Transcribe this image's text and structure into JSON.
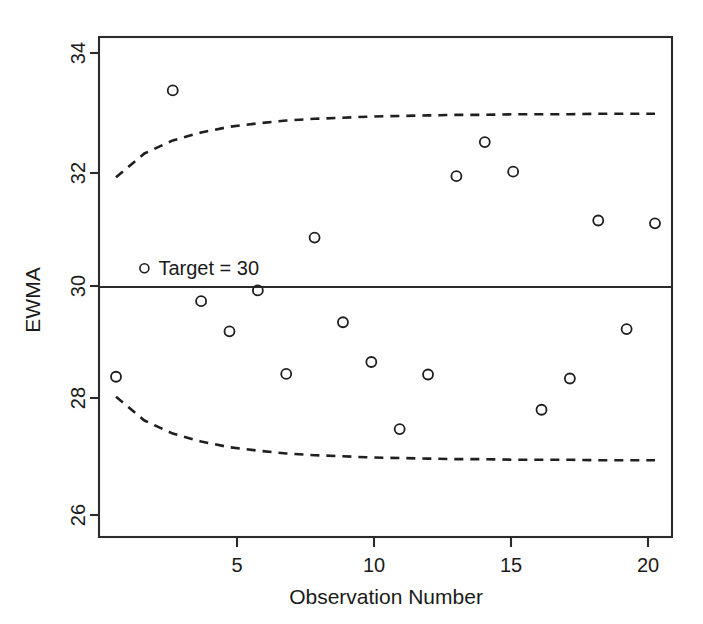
{
  "chart_data": {
    "type": "scatter",
    "title": "",
    "xlabel": "Observation Number",
    "ylabel": "EWMA",
    "xlim": [
      0.4,
      20.6
    ],
    "ylim": [
      25.6,
      34.4
    ],
    "xticks": [
      5,
      10,
      15,
      20
    ],
    "xtick_labels": [
      "5",
      "10",
      "15",
      "20"
    ],
    "yticks": [
      26,
      28,
      30,
      32,
      34
    ],
    "ytick_labels": [
      "26",
      "28",
      "30",
      "32",
      "34"
    ],
    "grid": false,
    "legend_position": "upper-left-inside",
    "annotations": [
      {
        "name": "target-annotation",
        "text": "Target = 30",
        "marker": "open-circle",
        "x": 2.0,
        "y": 30.33
      }
    ],
    "center_line": {
      "name": "Target",
      "value": 30
    },
    "series": [
      {
        "name": "EWMA",
        "marker": "open-circle",
        "x": [
          1,
          2,
          3,
          4,
          5,
          6,
          7,
          8,
          9,
          10,
          11,
          12,
          13,
          14,
          15,
          16,
          17,
          18,
          19,
          20
        ],
        "values": [
          28.42,
          33.46,
          33.46,
          29.75,
          29.22,
          29.94,
          28.47,
          30.87,
          29.38,
          28.68,
          27.5,
          28.46,
          31.95,
          32.55,
          32.03,
          27.84,
          28.39,
          31.17,
          29.26,
          31.12
        ],
        "points_drawn": [
          {
            "obs": 1,
            "value": 28.42
          },
          {
            "obs": 3,
            "value": 33.46
          },
          {
            "obs": 4,
            "value": 29.75
          },
          {
            "obs": 5,
            "value": 29.22
          },
          {
            "obs": 6,
            "value": 29.94
          },
          {
            "obs": 7,
            "value": 28.47
          },
          {
            "obs": 8,
            "value": 30.87
          },
          {
            "obs": 9,
            "value": 29.38
          },
          {
            "obs": 10,
            "value": 28.68
          },
          {
            "obs": 11,
            "value": 27.5
          },
          {
            "obs": 12,
            "value": 28.46
          },
          {
            "obs": 13,
            "value": 31.95
          },
          {
            "obs": 14,
            "value": 32.55
          },
          {
            "obs": 15,
            "value": 32.03
          },
          {
            "obs": 16,
            "value": 27.84
          },
          {
            "obs": 17,
            "value": 28.39
          },
          {
            "obs": 18,
            "value": 31.17
          },
          {
            "obs": 19,
            "value": 29.26
          },
          {
            "obs": 20,
            "value": 31.12
          }
        ]
      },
      {
        "name": "UCL",
        "style": "dashed",
        "x": [
          1,
          2,
          3,
          4,
          5,
          6,
          7,
          8,
          9,
          10,
          11,
          12,
          13,
          14,
          15,
          16,
          17,
          18,
          19,
          20
        ],
        "values": [
          31.93,
          32.35,
          32.58,
          32.72,
          32.82,
          32.88,
          32.93,
          32.96,
          32.98,
          33.0,
          33.01,
          33.02,
          33.03,
          33.03,
          33.04,
          33.04,
          33.04,
          33.05,
          33.05,
          33.05
        ]
      },
      {
        "name": "LCL",
        "style": "dashed",
        "x": [
          1,
          2,
          3,
          4,
          5,
          6,
          7,
          8,
          9,
          10,
          11,
          12,
          13,
          14,
          15,
          16,
          17,
          18,
          19,
          20
        ],
        "values": [
          28.07,
          27.65,
          27.42,
          27.28,
          27.18,
          27.12,
          27.07,
          27.04,
          27.02,
          27.0,
          26.99,
          26.98,
          26.97,
          26.97,
          26.96,
          26.96,
          26.96,
          26.95,
          26.95,
          26.95
        ]
      }
    ]
  },
  "axes": {
    "y_title": "EWMA",
    "x_title": "Observation Number"
  },
  "legend": {
    "target_label": "Target = 30"
  },
  "colors": {
    "line": "#1f1f1f",
    "frame": "#2b2b2b",
    "text": "#1a1a1a",
    "background": "#ffffff"
  }
}
